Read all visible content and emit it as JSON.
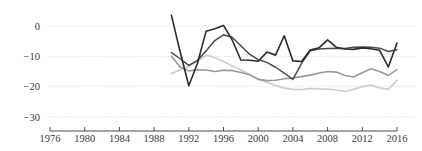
{
  "chart_data": {
    "type": "line",
    "title": "",
    "subtitle": "",
    "xlabel": "",
    "ylabel": "",
    "xlim": [
      1976,
      2016
    ],
    "ylim": [
      -33,
      4
    ],
    "grid": true,
    "grid_style": "dotted-horizontal",
    "legend": "none",
    "y_ticks": [
      0,
      -10,
      -20,
      -30
    ],
    "y_tick_labels": [
      "0",
      "−10",
      "−20",
      "−30"
    ],
    "x_ticks": [
      1976,
      1980,
      1984,
      1988,
      1992,
      1996,
      2000,
      2004,
      2008,
      2012,
      2016
    ],
    "x_tick_labels": [
      "1976",
      "1980",
      "1984",
      "1988",
      "1992",
      "1996",
      "2000",
      "2004",
      "2008",
      "2012",
      "2016"
    ],
    "x": [
      1990,
      1991,
      1992,
      1993,
      1994,
      1995,
      1996,
      1997,
      1998,
      1999,
      2000,
      2001,
      2002,
      2003,
      2004,
      2005,
      2006,
      2007,
      2008,
      2009,
      2010,
      2011,
      2012,
      2013,
      2014,
      2015,
      2016
    ],
    "series": [
      {
        "name": "series-1",
        "color": "#2b2b2b",
        "width": 1.6,
        "values": [
          3.5,
          -8.5,
          -19.7,
          -12.3,
          -1.7,
          -0.9,
          0.2,
          -4.6,
          -11.2,
          -11.3,
          -11.6,
          -8.6,
          -9.6,
          -3.2,
          -11.5,
          -11.7,
          -7.9,
          -7.2,
          -4.6,
          -7.0,
          -7.6,
          -7.7,
          -7.2,
          -7.5,
          -8.0,
          -13.5,
          -5.6
        ]
      },
      {
        "name": "series-2",
        "color": "#4a4a4a",
        "width": 1.5,
        "values": [
          -8.8,
          -10.8,
          -13.0,
          -11.3,
          -8.2,
          -4.8,
          -2.9,
          -3.7,
          -6.5,
          -9.3,
          -11.1,
          -12.0,
          -13.6,
          -15.5,
          -17.6,
          -12.3,
          -8.2,
          -7.6,
          -7.4,
          -7.3,
          -7.4,
          -7.0,
          -6.9,
          -7.0,
          -7.3,
          -8.4,
          -7.8
        ]
      },
      {
        "name": "series-3",
        "color": "#9a9a9a",
        "width": 1.6,
        "values": [
          -10.0,
          -13.5,
          -14.8,
          -14.4,
          -14.5,
          -15.0,
          -14.6,
          -14.7,
          -15.3,
          -16.1,
          -17.6,
          -18.0,
          -17.9,
          -17.4,
          -17.1,
          -16.7,
          -16.2,
          -15.5,
          -15.0,
          -15.2,
          -16.3,
          -16.8,
          -15.4,
          -14.1,
          -15.0,
          -16.3,
          -14.4
        ]
      },
      {
        "name": "series-4",
        "color": "#cfcfcf",
        "width": 1.7,
        "values": [
          -15.7,
          -14.4,
          -13.4,
          -11.6,
          -9.6,
          -10.4,
          -11.7,
          -13.2,
          -14.5,
          -15.9,
          -17.5,
          -18.6,
          -19.6,
          -20.5,
          -20.9,
          -21.0,
          -20.6,
          -20.7,
          -20.8,
          -21.1,
          -21.6,
          -20.9,
          -20.0,
          -19.5,
          -20.4,
          -20.9,
          -17.9
        ]
      }
    ]
  },
  "axis": {
    "axis_color": "#4a4a4a",
    "grid_color": "#d8d8d8",
    "tick_label_color": "#3a3a3a"
  }
}
